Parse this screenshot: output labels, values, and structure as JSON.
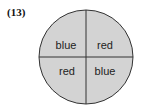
{
  "problem_number": "(13)",
  "spinner": {
    "fill_color": "#d3d3d3",
    "stroke_color": "#333333",
    "sections": [
      {
        "position": "top-left",
        "label": "blue"
      },
      {
        "position": "top-right",
        "label": "red"
      },
      {
        "position": "bottom-left",
        "label": "red"
      },
      {
        "position": "bottom-right",
        "label": "blue"
      }
    ]
  }
}
